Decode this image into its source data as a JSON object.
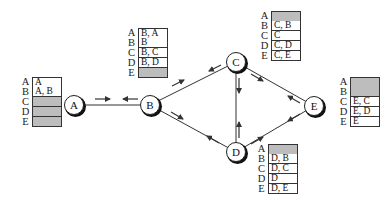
{
  "diagram": {
    "title": "",
    "nodes": [
      {
        "id": "A",
        "label": "A",
        "x": 74,
        "y": 105
      },
      {
        "id": "B",
        "label": "B",
        "x": 150,
        "y": 105
      },
      {
        "id": "C",
        "label": "C",
        "x": 236,
        "y": 62
      },
      {
        "id": "D",
        "label": "D",
        "x": 236,
        "y": 152
      },
      {
        "id": "E",
        "label": "E",
        "x": 314,
        "y": 106
      }
    ],
    "edges": [
      {
        "from": "A",
        "to": "B"
      },
      {
        "from": "B",
        "to": "C"
      },
      {
        "from": "B",
        "to": "D"
      },
      {
        "from": "C",
        "to": "D"
      },
      {
        "from": "C",
        "to": "E"
      },
      {
        "from": "D",
        "to": "E"
      }
    ],
    "arrows": [
      {
        "edge": "A-B",
        "direction": "A→B"
      },
      {
        "edge": "A-B",
        "direction": "B→A"
      },
      {
        "edge": "B-C",
        "direction": "B→C"
      },
      {
        "edge": "B-C",
        "direction": "C→B"
      },
      {
        "edge": "B-D",
        "direction": "B→D"
      },
      {
        "edge": "B-D",
        "direction": "D→B"
      },
      {
        "edge": "C-D",
        "direction": "C→D"
      },
      {
        "edge": "C-D",
        "direction": "D→C"
      },
      {
        "edge": "C-E",
        "direction": "C→E"
      },
      {
        "edge": "C-E",
        "direction": "E→C"
      },
      {
        "edge": "D-E",
        "direction": "D→E"
      },
      {
        "edge": "D-E",
        "direction": "E→D"
      }
    ]
  },
  "routing_tables": {
    "A": {
      "rows": [
        {
          "dest": "A",
          "entry": "A"
        },
        {
          "dest": "B",
          "entry": "A, B"
        },
        {
          "dest": "C",
          "entry": ""
        },
        {
          "dest": "D",
          "entry": ""
        },
        {
          "dest": "E",
          "entry": ""
        }
      ]
    },
    "B": {
      "rows": [
        {
          "dest": "A",
          "entry": "B, A"
        },
        {
          "dest": "B",
          "entry": "B"
        },
        {
          "dest": "C",
          "entry": "B, C"
        },
        {
          "dest": "D",
          "entry": "B, D"
        },
        {
          "dest": "E",
          "entry": ""
        }
      ]
    },
    "C": {
      "rows": [
        {
          "dest": "A",
          "entry": ""
        },
        {
          "dest": "B",
          "entry": "C, B"
        },
        {
          "dest": "C",
          "entry": "C"
        },
        {
          "dest": "D",
          "entry": "C, D"
        },
        {
          "dest": "E",
          "entry": "C, E"
        }
      ]
    },
    "D": {
      "rows": [
        {
          "dest": "A",
          "entry": ""
        },
        {
          "dest": "B",
          "entry": "D, B"
        },
        {
          "dest": "C",
          "entry": "D, C"
        },
        {
          "dest": "D",
          "entry": "D"
        },
        {
          "dest": "E",
          "entry": "D, E"
        }
      ]
    },
    "E": {
      "rows": [
        {
          "dest": "A",
          "entry": ""
        },
        {
          "dest": "B",
          "entry": ""
        },
        {
          "dest": "C",
          "entry": "E, C"
        },
        {
          "dest": "D",
          "entry": "E, D"
        },
        {
          "dest": "E",
          "entry": "E"
        }
      ]
    }
  },
  "colors": {
    "empty_cell": "#bdbdbd",
    "line": "#333333"
  }
}
